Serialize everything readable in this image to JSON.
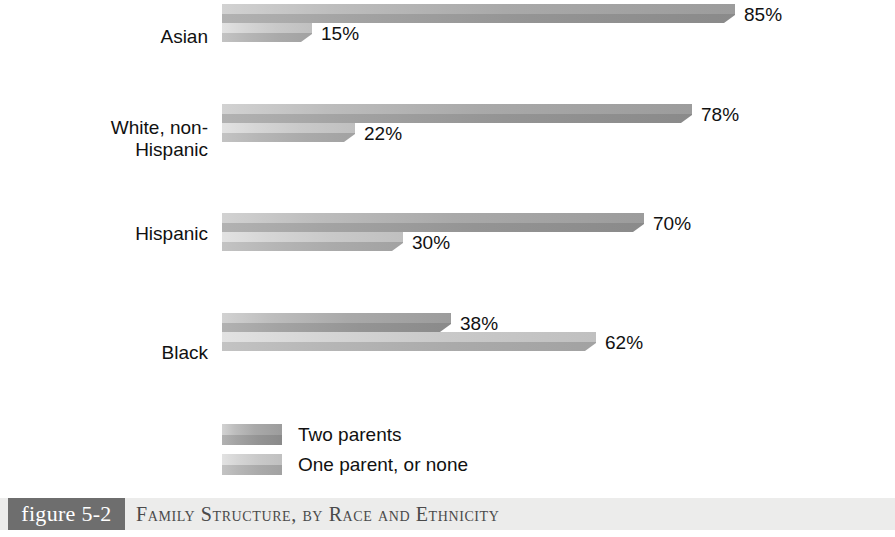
{
  "chart_data": {
    "type": "bar",
    "orientation": "horizontal",
    "title": "Family Structure, by Race and Ethnicity",
    "figure_number": "figure 5-2",
    "xlabel": "",
    "ylabel": "",
    "xlim": [
      0,
      100
    ],
    "grid": false,
    "legend_position": "bottom-left",
    "value_suffix": "%",
    "categories": [
      "Asian",
      "White, non-\nHispanic",
      "Hispanic",
      "Black"
    ],
    "series": [
      {
        "name": "Two parents",
        "color": "#9c9c9c",
        "values": [
          85,
          78,
          70,
          38
        ],
        "labels": [
          "85%",
          "78%",
          "70%",
          "38%"
        ]
      },
      {
        "name": "One parent, or none",
        "color": "#c0c0c0",
        "values": [
          15,
          22,
          30,
          62
        ],
        "labels": [
          "15%",
          "22%",
          "30%",
          "62%"
        ]
      }
    ]
  },
  "legend": {
    "items": [
      {
        "label": "Two parents",
        "series_class": "s-two"
      },
      {
        "label": "One parent, or none",
        "series_class": "s-one"
      }
    ]
  },
  "caption": {
    "tag": "figure 5-2",
    "title": "Family Structure, by Race and Ethnicity"
  },
  "layout": {
    "plot_left": 222,
    "px_per_percent": 6.03,
    "group_tops": [
      4,
      104,
      213,
      313
    ],
    "bar_height": 19,
    "label_tops": [
      26,
      117,
      223,
      342
    ]
  }
}
